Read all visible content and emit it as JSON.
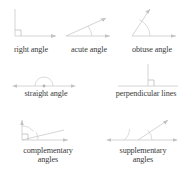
{
  "sheet": {
    "title": "Types of angles reference figures",
    "background_color": "#ffffff",
    "line_color": "#c9c9c9",
    "text_color": "#3b3b3b"
  },
  "figures": [
    {
      "id": "right-angle",
      "caption": "right angle",
      "measure_label": "90°",
      "marker": "square",
      "row": 1,
      "column": 1
    },
    {
      "id": "acute-angle",
      "caption": "acute angle",
      "measure_label": "less than 90°",
      "marker": "arc",
      "row": 1,
      "column": 2
    },
    {
      "id": "obtuse-angle",
      "caption": "obtuse angle",
      "measure_label": "greater than 90°",
      "marker": "arc",
      "row": 1,
      "column": 3
    },
    {
      "id": "straight-angle",
      "caption": "straight angle",
      "measure_label": "180°",
      "marker": "arc",
      "row": 2,
      "column": 1
    },
    {
      "id": "perpendicular-lines",
      "caption": "perpendicular lines",
      "measure_label": "90°",
      "marker": "square",
      "row": 2,
      "column": 2
    },
    {
      "id": "complementary-angles",
      "caption_line1": "complementary",
      "caption_line2": "angles",
      "measure_label": "sum 90°",
      "marker": "square",
      "row": 3,
      "column": 1
    },
    {
      "id": "supplementary-angles",
      "caption_line1": "supplementary",
      "caption_line2": "angles",
      "measure_label": "sum 180°",
      "marker": "arc",
      "row": 3,
      "column": 2
    }
  ]
}
